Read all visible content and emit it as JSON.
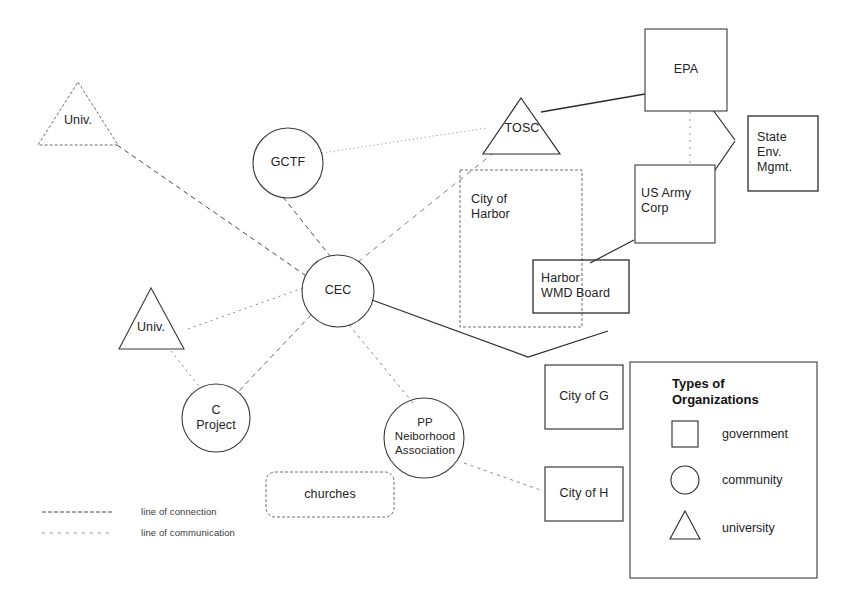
{
  "diagram": {
    "type": "organizational-network-diagram",
    "nodes": [
      {
        "id": "univ_top",
        "label": "Univ.",
        "shape": "triangle",
        "category": "university"
      },
      {
        "id": "univ_bottom",
        "label": "Univ.",
        "shape": "triangle",
        "category": "university"
      },
      {
        "id": "tosc",
        "label": "TOSC",
        "shape": "triangle",
        "category": "university"
      },
      {
        "id": "gctf",
        "label": "GCTF",
        "shape": "circle",
        "category": "community"
      },
      {
        "id": "cec",
        "label": "CEC",
        "shape": "circle",
        "category": "community"
      },
      {
        "id": "c_project",
        "label": "C\nProject",
        "shape": "circle",
        "category": "community"
      },
      {
        "id": "pp_assoc",
        "label": "PP\nNeiborhood\nAssociation",
        "shape": "ellipse",
        "category": "community"
      },
      {
        "id": "churches",
        "label": "churches",
        "shape": "rounded-rect",
        "category": "community"
      },
      {
        "id": "epa",
        "label": "EPA",
        "shape": "rect",
        "category": "government"
      },
      {
        "id": "state_env",
        "label": "State\nEnv.\nMgmt.",
        "shape": "rect",
        "category": "government"
      },
      {
        "id": "us_army",
        "label": "US Army\nCorp",
        "shape": "rect",
        "category": "government"
      },
      {
        "id": "city_harbor",
        "label": "City of\nHarbor",
        "shape": "rect",
        "category": "government"
      },
      {
        "id": "harbor_wmd",
        "label": "Harbor\nWMD Board",
        "shape": "rect",
        "category": "government"
      },
      {
        "id": "city_g",
        "label": "City of G",
        "shape": "rect",
        "category": "government"
      },
      {
        "id": "city_h",
        "label": "City of H",
        "shape": "rect",
        "category": "government"
      }
    ],
    "edges": [
      {
        "from": "univ_top",
        "to": "cec",
        "style": "connection"
      },
      {
        "from": "gctf",
        "to": "tosc",
        "style": "communication"
      },
      {
        "from": "gctf",
        "to": "cec",
        "style": "connection"
      },
      {
        "from": "cec",
        "to": "tosc",
        "style": "communication"
      },
      {
        "from": "cec",
        "to": "c_project",
        "style": "connection"
      },
      {
        "from": "cec",
        "to": "univ_bottom",
        "style": "communication"
      },
      {
        "from": "cec",
        "to": "pp_assoc",
        "style": "communication"
      },
      {
        "from": "cec",
        "to": "harbor_wmd",
        "style": "solid"
      },
      {
        "from": "univ_bottom",
        "to": "c_project",
        "style": "communication"
      },
      {
        "from": "tosc",
        "to": "epa",
        "style": "solid"
      },
      {
        "from": "epa",
        "to": "state_env",
        "style": "solid"
      },
      {
        "from": "us_army",
        "to": "state_env",
        "style": "solid"
      },
      {
        "from": "epa",
        "to": "us_army",
        "style": "communication"
      },
      {
        "from": "us_army",
        "to": "harbor_wmd",
        "style": "solid"
      },
      {
        "from": "pp_assoc",
        "to": "city_h",
        "style": "communication"
      }
    ]
  },
  "legend": {
    "title": "Types of\nOrganizations",
    "items": [
      {
        "shape": "square",
        "label": "government"
      },
      {
        "shape": "circle",
        "label": "community"
      },
      {
        "shape": "triangle",
        "label": "university"
      }
    ]
  },
  "line_key": {
    "items": [
      {
        "style": "connection",
        "label": "line of connection"
      },
      {
        "style": "communication",
        "label": "line of communication"
      }
    ]
  },
  "colors": {
    "stroke": "#2b2b2b",
    "faint_stroke": "#6e6e6e",
    "text": "#232323",
    "background": "#ffffff"
  }
}
